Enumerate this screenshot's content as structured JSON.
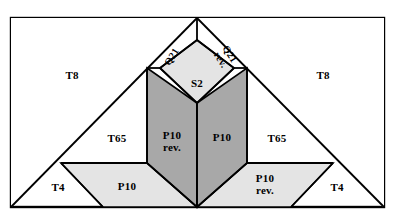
{
  "figure": {
    "background_color": "#ffffff",
    "stroke_color": "#000000",
    "fill_white": "#ffffff",
    "fill_light_gray": "#e4e4e4",
    "fill_dark_gray": "#a8a8a8",
    "frame": {
      "x": 11,
      "y": 18,
      "width": 373,
      "height": 189
    }
  },
  "pieces": [
    {
      "id": "t8-left",
      "label": "T8",
      "fill": "#ffffff",
      "label_x": 72,
      "label_y": 76,
      "rotation": "none"
    },
    {
      "id": "t8-right",
      "label": "T8",
      "fill": "#ffffff",
      "label_x": 323,
      "label_y": 76,
      "rotation": "none"
    },
    {
      "id": "q21-left",
      "label": "Q21",
      "fill": "#ffffff",
      "label_x": 172,
      "label_y": 57,
      "rotation": "left"
    },
    {
      "id": "q21-right",
      "label": "Q21\nrev.",
      "fill": "#ffffff",
      "label_x": 224,
      "label_y": 57,
      "rotation": "right"
    },
    {
      "id": "s2-diamond",
      "label": "S2",
      "fill": "#e4e4e4",
      "label_x": 197,
      "label_y": 84,
      "rotation": "none"
    },
    {
      "id": "t65-left",
      "label": "T65",
      "fill": "#ffffff",
      "label_x": 117,
      "label_y": 139,
      "rotation": "none"
    },
    {
      "id": "t65-right",
      "label": "T65",
      "fill": "#ffffff",
      "label_x": 277,
      "label_y": 139,
      "rotation": "none"
    },
    {
      "id": "p10-rev-center",
      "label": "P10\nrev.",
      "fill": "#a8a8a8",
      "label_x": 172,
      "label_y": 142,
      "rotation": "none"
    },
    {
      "id": "p10-center",
      "label": "P10",
      "fill": "#a8a8a8",
      "label_x": 222,
      "label_y": 138,
      "rotation": "none"
    },
    {
      "id": "t4-left",
      "label": "T4",
      "fill": "#ffffff",
      "label_x": 58,
      "label_y": 188,
      "rotation": "none"
    },
    {
      "id": "t4-right",
      "label": "T4",
      "fill": "#ffffff",
      "label_x": 337,
      "label_y": 188,
      "rotation": "none"
    },
    {
      "id": "p10-bottom",
      "label": "P10",
      "fill": "#e4e4e4",
      "label_x": 127,
      "label_y": 187,
      "rotation": "none"
    },
    {
      "id": "p10-rev-bottom",
      "label": "P10\nrev.",
      "fill": "#e4e4e4",
      "label_x": 265,
      "label_y": 185,
      "rotation": "none"
    }
  ],
  "labels": {
    "t8": "T8",
    "t65": "T65",
    "t4": "T4",
    "s2": "S2",
    "p10": "P10",
    "p10_rev": "P10\nrev.",
    "q21": "Q21",
    "q21_rev": "Q21\nrev."
  }
}
